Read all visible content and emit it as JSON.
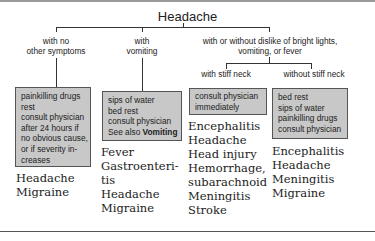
{
  "title": "Headache",
  "branches": [
    {
      "label_lines": [
        "with no",
        "other symptoms"
      ],
      "advice": [
        "painkilling drugs",
        "rest",
        "consult physician",
        "after 24 hours if",
        "no obvious cause,",
        "or if severity in-",
        "creases"
      ],
      "diagnoses": [
        "Headache",
        "Migraine"
      ]
    },
    {
      "label_lines": [
        "with",
        "vomiting"
      ],
      "advice": [
        "sips of water",
        "bed rest",
        "consult physician"
      ],
      "advice_see_also": {
        "prefix": "See also ",
        "link": "Vomiting"
      },
      "diagnoses": [
        "Fever",
        "Gastroenteri-",
        "tis",
        "Headache",
        "Migraine"
      ]
    },
    {
      "label_lines": [
        "with or without dislike of bright lights,",
        "vomiting, or fever"
      ],
      "sub_branches": [
        {
          "label": "with stiff neck",
          "advice": [
            "consult physician",
            "immediately"
          ],
          "diagnoses": [
            "Encephalitis",
            "Headache",
            "Head injury",
            "Hemorrhage,",
            "subarachnoid",
            "Meningitis",
            "Stroke"
          ]
        },
        {
          "label": "without stiff neck",
          "advice": [
            "bed rest",
            "sips of water",
            "painkilling drugs",
            "consult physician"
          ],
          "diagnoses": [
            "Encephalitis",
            "Headache",
            "Meningitis",
            "Migraine"
          ]
        }
      ]
    }
  ],
  "colors": {
    "box_fill": "#c8c8c8",
    "line": "#333333"
  }
}
